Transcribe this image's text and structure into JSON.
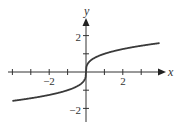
{
  "chart_data": {
    "type": "line",
    "title": "",
    "xlabel": "x",
    "ylabel": "y",
    "function": "y = cbrt(x)",
    "xlim": [
      -4,
      4
    ],
    "ylim": [
      -2.7,
      2.9
    ],
    "x_ticks": [
      -4,
      -3,
      -2,
      -1,
      1,
      2,
      3
    ],
    "y_ticks": [
      -2,
      -1,
      1,
      2
    ],
    "x_tick_labels": [
      {
        "value": -2,
        "text": "−2"
      },
      {
        "value": 2,
        "text": "2"
      }
    ],
    "y_tick_labels": [
      {
        "value": 2,
        "text": "2"
      },
      {
        "value": -2,
        "text": "−2"
      }
    ],
    "grid": false,
    "legend": null,
    "series": [
      {
        "name": "cube root",
        "x": [
          -4,
          -3,
          -2,
          -1,
          -0.5,
          -0.125,
          0,
          0.125,
          0.5,
          1,
          2,
          3,
          4
        ],
        "y": [
          -1.587,
          -1.442,
          -1.26,
          -1,
          -0.794,
          -0.5,
          0,
          0.5,
          0.794,
          1,
          1.26,
          1.442,
          1.587
        ]
      }
    ]
  },
  "labels": {
    "x_axis": "x",
    "y_axis": "y",
    "x_neg2": "−2",
    "x_pos2": "2",
    "y_pos2": "2",
    "y_neg2": "−2"
  }
}
